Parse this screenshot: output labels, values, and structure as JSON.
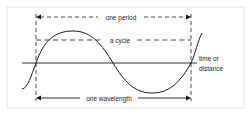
{
  "diagram": {
    "labels": {
      "period": "one period",
      "cycle": "a cycle",
      "axis_line1": "time or",
      "axis_line2": "distance",
      "wavelength": "one wavelength"
    },
    "colors": {
      "line": "#1a1a1a",
      "frame": "#e2e2e2",
      "background": "#ffffff"
    }
  }
}
